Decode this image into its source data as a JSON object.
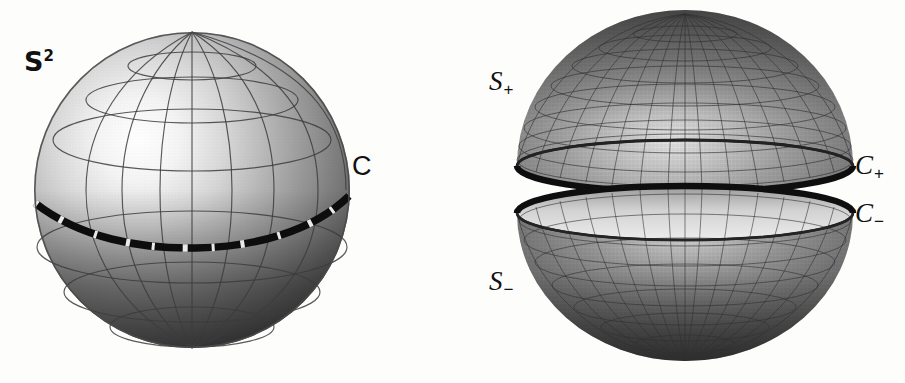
{
  "figure": {
    "background_color": "#fdfdfc",
    "ink_color": "#111111",
    "panels": [
      {
        "id": "left-panel",
        "name": "whole-sphere",
        "caption": "Whole sphere with marked equator"
      },
      {
        "id": "right-panel",
        "name": "split-sphere",
        "caption": "Sphere separated into upper and lower hemispheres"
      }
    ]
  },
  "labels": {
    "sphere": {
      "base": "S",
      "sup": "2",
      "text": "S2",
      "panel": "left-panel",
      "x": 24,
      "y": 50
    },
    "equator": {
      "text": "C",
      "panel": "left-panel",
      "x": 352,
      "y": 155
    },
    "upper_hemisphere": {
      "base": "S",
      "sub": "+",
      "text": "S+",
      "panel": "right-panel",
      "x": 489,
      "y": 70
    },
    "lower_hemisphere": {
      "base": "S",
      "sub": "−",
      "text": "S−",
      "panel": "right-panel",
      "x": 489,
      "y": 270
    },
    "upper_boundary": {
      "base": "C",
      "sub": "+",
      "text": "C+",
      "panel": "right-panel",
      "x": 855,
      "y": 155
    },
    "lower_boundary": {
      "base": "C",
      "sub": "−",
      "text": "C−",
      "panel": "right-panel",
      "x": 855,
      "y": 205
    }
  },
  "geometry": {
    "left_sphere": {
      "center_x": 192,
      "center_y": 190,
      "radius": 158,
      "meridian_count": 8,
      "parallel_count": 6,
      "equator_style": "thick-dashed",
      "highlight_x": 150,
      "highlight_y": 170
    },
    "upper_hemisphere": {
      "center_x": 685,
      "center_y": 170,
      "radius_x": 168,
      "radius_y": 156,
      "rim_ry": 26,
      "rim_cy": 166,
      "meridian_count": 20,
      "parallel_count": 9
    },
    "lower_hemisphere": {
      "center_x": 685,
      "center_y": 213,
      "radius_x": 168,
      "radius_y": 148,
      "rim_ry": 27,
      "rim_cy": 213,
      "meridian_count": 20,
      "parallel_count": 9
    }
  },
  "palette": {
    "highlight": "#ffffff",
    "mid_gray": "#a8a8a8",
    "dark_gray": "#4a4a4a",
    "shadow": "#2b2b2b",
    "rim_dark": "#1a1a1a",
    "grid_line": "#3a3a3a",
    "inner_light": "#d6d6d6"
  }
}
